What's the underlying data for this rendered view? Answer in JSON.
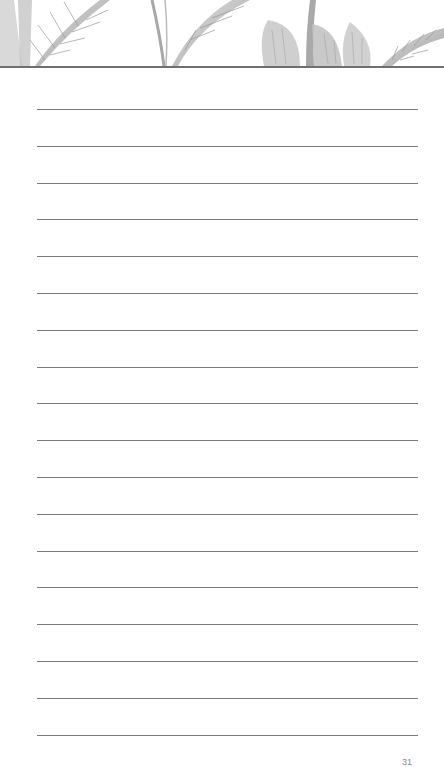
{
  "page": {
    "type": "lined-notes-page",
    "background_color": "#ffffff",
    "line_color": "#7a7a7a",
    "header_rule_color": "#6f6f6f"
  },
  "header": {
    "illustration": "tropical-palm-leaves-illustration",
    "tone": "grayscale"
  },
  "ruled_lines": {
    "count": 18,
    "start_y": 109,
    "spacing": 36.8,
    "left": 37,
    "right": 418
  },
  "footer": {
    "page_number": "31"
  }
}
